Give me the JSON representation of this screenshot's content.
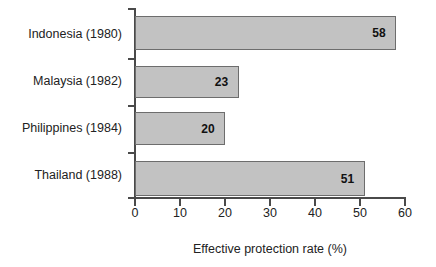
{
  "chart_data": {
    "type": "bar",
    "orientation": "horizontal",
    "title": "",
    "subtitle": "",
    "xlabel": "Effective protection rate (%)",
    "ylabel": "",
    "categories": [
      "Indonesia (1980)",
      "Malaysia (1982)",
      "Philippines (1984)",
      "Thailand (1988)"
    ],
    "values": [
      58,
      23,
      20,
      51
    ],
    "value_labels": [
      "58",
      "23",
      "20",
      "51"
    ],
    "xlim": [
      0,
      60
    ],
    "xticks": [
      0,
      10,
      20,
      30,
      40,
      50,
      60
    ],
    "xtick_labels": [
      "0",
      "10",
      "20",
      "30",
      "40",
      "50",
      "60"
    ],
    "grid": false,
    "legend": false,
    "legend_position": "none",
    "bar_fill_color": "#c2c2c2",
    "bar_border_color": "#6d6d6d",
    "axis_color": "#4a4a4a",
    "background_color": "#ffffff",
    "text_color": "#222222"
  }
}
